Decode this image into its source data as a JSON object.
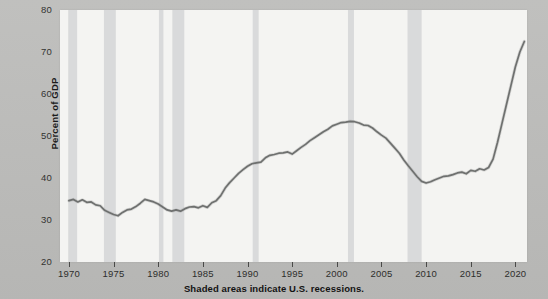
{
  "figure": {
    "caption": "Shaded areas indicate U.S. recessions.",
    "y_axis_title": "Percent of GDP"
  },
  "chart_data": {
    "type": "line",
    "title": "",
    "subtitle": "",
    "xlabel": "",
    "ylabel": "Percent of GDP",
    "annotation": "Shaded areas indicate U.S. recessions.",
    "xlim": [
      1969.0,
      2021.3
    ],
    "ylim": [
      20,
      80
    ],
    "x_ticks": [
      1970,
      1975,
      1980,
      1985,
      1990,
      1995,
      2000,
      2005,
      2010,
      2015,
      2020
    ],
    "y_ticks": [
      20,
      30,
      40,
      50,
      60,
      70,
      80
    ],
    "grid": false,
    "legend": "none",
    "line_color": "#6e706f",
    "recession_band_color": "#d9dadb",
    "plot_background": "#f4f4f2",
    "page_background": "#bcbcba",
    "recessions": [
      {
        "start": 1969.92,
        "end": 1970.92
      },
      {
        "start": 1973.92,
        "end": 1975.25
      },
      {
        "start": 1980.08,
        "end": 1980.58
      },
      {
        "start": 1981.58,
        "end": 1982.92
      },
      {
        "start": 1990.58,
        "end": 1991.25
      },
      {
        "start": 2001.25,
        "end": 2001.92
      },
      {
        "start": 2007.92,
        "end": 2009.5
      }
    ],
    "series": [
      {
        "name": "Federal debt held by the public",
        "units": "Percent of GDP",
        "x": [
          1970.0,
          1970.5,
          1971.0,
          1971.5,
          1972.0,
          1972.5,
          1973.0,
          1973.5,
          1974.0,
          1974.5,
          1975.0,
          1975.5,
          1976.0,
          1976.5,
          1977.0,
          1977.5,
          1978.0,
          1978.5,
          1979.0,
          1979.5,
          1980.0,
          1980.5,
          1981.0,
          1981.5,
          1982.0,
          1982.5,
          1983.0,
          1983.5,
          1984.0,
          1984.5,
          1985.0,
          1985.5,
          1986.0,
          1986.5,
          1987.0,
          1987.5,
          1988.0,
          1988.5,
          1989.0,
          1989.5,
          1990.0,
          1990.5,
          1991.0,
          1991.5,
          1992.0,
          1992.5,
          1993.0,
          1993.5,
          1994.0,
          1994.5,
          1995.0,
          1995.5,
          1996.0,
          1996.5,
          1997.0,
          1997.5,
          1998.0,
          1998.5,
          1999.0,
          1999.5,
          2000.0,
          2000.5,
          2001.0,
          2001.5,
          2002.0,
          2002.5,
          2003.0,
          2003.5,
          2004.0,
          2004.5,
          2005.0,
          2005.5,
          2006.0,
          2006.5,
          2007.0,
          2007.5,
          2008.0,
          2008.5,
          2009.0,
          2009.5,
          2010.0,
          2010.5,
          2011.0,
          2011.5,
          2012.0,
          2012.5,
          2013.0,
          2013.5,
          2014.0,
          2014.5,
          2015.0,
          2015.5,
          2016.0,
          2016.5,
          2017.0,
          2017.5,
          2018.0,
          2018.5,
          2019.0,
          2019.5,
          2020.0,
          2020.5,
          2021.0
        ],
        "values": [
          34.6,
          34.9,
          34.3,
          34.8,
          34.2,
          34.3,
          33.6,
          33.4,
          32.3,
          31.8,
          31.3,
          31.0,
          31.8,
          32.4,
          32.6,
          33.2,
          34.0,
          34.9,
          34.6,
          34.3,
          33.8,
          33.1,
          32.4,
          32.1,
          32.4,
          32.1,
          32.7,
          33.1,
          33.2,
          32.9,
          33.4,
          33.0,
          34.1,
          34.6,
          35.8,
          37.6,
          38.9,
          40.0,
          41.1,
          42.0,
          42.8,
          43.4,
          43.6,
          43.8,
          44.8,
          45.4,
          45.6,
          45.9,
          46.0,
          46.2,
          45.7,
          46.5,
          47.3,
          48.0,
          48.9,
          49.6,
          50.3,
          51.0,
          51.6,
          52.4,
          52.8,
          53.2,
          53.3,
          53.5,
          53.4,
          53.1,
          52.6,
          52.5,
          51.9,
          51.0,
          50.2,
          49.5,
          48.3,
          47.1,
          45.9,
          44.3,
          42.9,
          41.6,
          40.3,
          39.2,
          38.8,
          39.1,
          39.6,
          40.0,
          40.4,
          40.5,
          40.8,
          41.2,
          41.4,
          41.0,
          41.8,
          41.6,
          42.2,
          41.9,
          42.5,
          44.5,
          48.5,
          53.0,
          57.5,
          62.0,
          66.5,
          70.0,
          72.5
        ]
      }
    ],
    "series_note": "Series rises steeply after 2010 from about 42% to about 80% by 2020-2021; early-1970s level near 35%, trough near 31% in 1975, mid-1990s peak near 53%, trough near 39% in 2007."
  },
  "y_axis": {
    "ticks": [
      {
        "label": "80",
        "value": 80
      },
      {
        "label": "70",
        "value": 70
      },
      {
        "label": "60",
        "value": 60
      },
      {
        "label": "50",
        "value": 50
      },
      {
        "label": "40",
        "value": 40
      },
      {
        "label": "30",
        "value": 30
      },
      {
        "label": "20",
        "value": 20
      }
    ]
  },
  "x_axis": {
    "ticks": [
      {
        "label": "1970",
        "value": 1970
      },
      {
        "label": "1975",
        "value": 1975
      },
      {
        "label": "1980",
        "value": 1980
      },
      {
        "label": "1985",
        "value": 1985
      },
      {
        "label": "1990",
        "value": 1990
      },
      {
        "label": "1995",
        "value": 1995
      },
      {
        "label": "2000",
        "value": 2000
      },
      {
        "label": "2005",
        "value": 2005
      },
      {
        "label": "2010",
        "value": 2010
      },
      {
        "label": "2015",
        "value": 2015
      },
      {
        "label": "2020",
        "value": 2020
      }
    ]
  }
}
